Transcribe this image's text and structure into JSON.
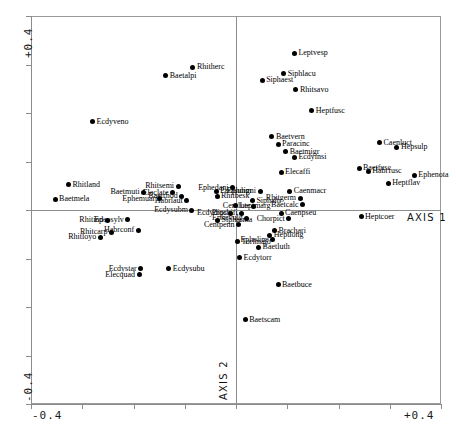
{
  "chart_data": {
    "type": "scatter",
    "title": "",
    "xlabel": "AXIS 1",
    "ylabel": "AXIS 2",
    "xlim": [
      -0.4,
      0.4
    ],
    "ylim": [
      -0.4,
      0.4
    ],
    "xticks": [
      -0.4,
      -0.3,
      -0.2,
      -0.1,
      0.0,
      0.1,
      0.2,
      0.3,
      0.4
    ],
    "yticks": [
      -0.4,
      -0.3,
      -0.2,
      -0.1,
      0.0,
      0.1,
      0.2,
      0.3,
      0.4
    ],
    "xtick_labels": [
      "-0.4",
      "+0.4"
    ],
    "ytick_labels": [
      "-0.4",
      "+0.4"
    ],
    "grid": false,
    "legend": null,
    "points": [
      {
        "label": "Baetalpi",
        "x": -0.137,
        "y": 0.277,
        "side": "r"
      },
      {
        "label": "Rhitherc",
        "x": -0.084,
        "y": 0.294,
        "side": "r"
      },
      {
        "label": "Ecdyveno",
        "x": -0.28,
        "y": 0.182,
        "side": "r"
      },
      {
        "label": "Leptvesp",
        "x": 0.114,
        "y": 0.323,
        "side": "r"
      },
      {
        "label": "Siphlacu",
        "x": 0.093,
        "y": 0.281,
        "side": "r"
      },
      {
        "label": "Siphaest",
        "x": 0.051,
        "y": 0.268,
        "side": "r"
      },
      {
        "label": "Rhitsavo",
        "x": 0.117,
        "y": 0.248,
        "side": "r"
      },
      {
        "label": "Heptfusc",
        "x": 0.148,
        "y": 0.205,
        "side": "r"
      },
      {
        "label": "Baetvern",
        "x": 0.07,
        "y": 0.151,
        "side": "r"
      },
      {
        "label": "Paracinc",
        "x": 0.082,
        "y": 0.136,
        "side": "r"
      },
      {
        "label": "Baetmigr",
        "x": 0.097,
        "y": 0.12,
        "side": "r"
      },
      {
        "label": "Ecdyinsi",
        "x": 0.114,
        "y": 0.109,
        "side": "r"
      },
      {
        "label": "Elecaffi",
        "x": 0.088,
        "y": 0.078,
        "side": "r"
      },
      {
        "label": "Caenluct",
        "x": 0.28,
        "y": 0.139,
        "side": "r"
      },
      {
        "label": "Hepsulp",
        "x": 0.314,
        "y": 0.129,
        "side": "r"
      },
      {
        "label": "Baetfusc",
        "x": 0.24,
        "y": 0.086,
        "side": "r"
      },
      {
        "label": "Habrfusc",
        "x": 0.258,
        "y": 0.08,
        "side": "r"
      },
      {
        "label": "Ephenota",
        "x": 0.348,
        "y": 0.072,
        "side": "r"
      },
      {
        "label": "Heptflav",
        "x": 0.297,
        "y": 0.055,
        "side": "r"
      },
      {
        "label": "Rhitland",
        "x": -0.327,
        "y": 0.052,
        "side": "r"
      },
      {
        "label": "Baetmela",
        "x": -0.353,
        "y": 0.022,
        "side": "r"
      },
      {
        "label": "Rhitsemi",
        "x": -0.113,
        "y": 0.049,
        "side": "l"
      },
      {
        "label": "Baetmuti",
        "x": -0.18,
        "y": 0.037,
        "side": "l"
      },
      {
        "label": "Eleclate",
        "x": -0.124,
        "y": 0.036,
        "side": "l"
      },
      {
        "label": "Baetrhod",
        "x": -0.106,
        "y": 0.028,
        "side": "l"
      },
      {
        "label": "Ephemuar",
        "x": -0.15,
        "y": 0.023,
        "side": "l"
      },
      {
        "label": "Habrlaut",
        "x": -0.096,
        "y": 0.019,
        "side": "l"
      },
      {
        "label": "Parasubm",
        "x": -0.039,
        "y": 0.039,
        "side": "r"
      },
      {
        "label": "Rhitbesk",
        "x": -0.037,
        "y": 0.028,
        "side": "r"
      },
      {
        "label": "Ephedani",
        "x": -0.007,
        "y": 0.046,
        "side": "l"
      },
      {
        "label": "Ephoigni",
        "x": 0.047,
        "y": 0.039,
        "side": "l"
      },
      {
        "label": "Caenmacr",
        "x": 0.105,
        "y": 0.039,
        "side": "r"
      },
      {
        "label": "Rhitgerm",
        "x": 0.125,
        "y": 0.024,
        "side": "l"
      },
      {
        "label": "Baetcalc",
        "x": 0.13,
        "y": 0.011,
        "side": "l"
      },
      {
        "label": "Siphaltr",
        "x": 0.032,
        "y": 0.019,
        "side": "r"
      },
      {
        "label": "Leptmarg",
        "x": -0.001,
        "y": 0.009,
        "side": "r"
      },
      {
        "label": "Centlute",
        "x": 0.035,
        "y": 0.008,
        "side": "l"
      },
      {
        "label": "Ecdysubm",
        "x": -0.086,
        "y": 0.0,
        "side": "l"
      },
      {
        "label": "Procbifi",
        "x": 0.011,
        "y": -0.007,
        "side": "l"
      },
      {
        "label": "Caenpseu",
        "x": 0.088,
        "y": -0.007,
        "side": "r"
      },
      {
        "label": "Ephevulg",
        "x": 0.021,
        "y": -0.017,
        "side": "l"
      },
      {
        "label": "Chorpict",
        "x": 0.103,
        "y": -0.018,
        "side": "l"
      },
      {
        "label": "Ecdydips",
        "x": -0.01,
        "y": -0.007,
        "side": "l"
      },
      {
        "label": "Heptcoer",
        "x": 0.244,
        "y": -0.014,
        "side": "r"
      },
      {
        "label": "Sipharma",
        "x": -0.036,
        "y": -0.021,
        "side": "r"
      },
      {
        "label": "Centpenn",
        "x": 0.005,
        "y": -0.03,
        "side": "l"
      },
      {
        "label": "Epeosylv",
        "x": -0.211,
        "y": -0.02,
        "side": "l"
      },
      {
        "label": "Rhitind",
        "x": -0.251,
        "y": -0.021,
        "side": "l"
      },
      {
        "label": "Habrconf",
        "x": -0.191,
        "y": -0.042,
        "side": "l"
      },
      {
        "label": "Rhitcarp",
        "x": -0.243,
        "y": -0.046,
        "side": "l"
      },
      {
        "label": "Rhitloyo",
        "x": -0.265,
        "y": -0.056,
        "side": "l"
      },
      {
        "label": "Brachari",
        "x": 0.075,
        "y": -0.043,
        "side": "r"
      },
      {
        "label": "Heptlong",
        "x": 0.066,
        "y": -0.052,
        "side": "r"
      },
      {
        "label": "Epheline",
        "x": 0.072,
        "y": -0.061,
        "side": "l"
      },
      {
        "label": "Torlmajo",
        "x": 0.003,
        "y": -0.065,
        "side": "r"
      },
      {
        "label": "Baetluth",
        "x": 0.044,
        "y": -0.077,
        "side": "r"
      },
      {
        "label": "Ecdytorr",
        "x": 0.007,
        "y": -0.098,
        "side": "r"
      },
      {
        "label": "Ecdystar",
        "x": -0.186,
        "y": -0.121,
        "side": "l"
      },
      {
        "label": "Ecdysubu",
        "x": -0.131,
        "y": -0.121,
        "side": "r"
      },
      {
        "label": "Elecquad",
        "x": -0.189,
        "y": -0.134,
        "side": "l"
      },
      {
        "label": "Baetbuce",
        "x": 0.082,
        "y": -0.154,
        "side": "r"
      },
      {
        "label": "Baetscam",
        "x": 0.018,
        "y": -0.226,
        "side": "r"
      }
    ]
  },
  "axes": {
    "x_title": "AXIS 1",
    "y_title": "AXIS 2",
    "x_min_label": "-0.4",
    "x_max_label": "+0.4",
    "y_min_label": "-0.4",
    "y_max_label": "+0.4"
  },
  "colors": {
    "point": "#000000",
    "axis": "#8c8c8c",
    "frame": "#9a9a9a",
    "text": "#000000"
  }
}
